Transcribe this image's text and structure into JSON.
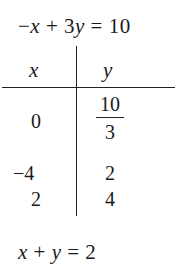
{
  "title_equation": {
    "parts": [
      "−",
      "x",
      " + 3",
      "y",
      " = 10"
    ]
  },
  "table": {
    "headers": {
      "x": "x",
      "y": "y"
    },
    "rows": [
      {
        "x": "0",
        "y_num": "10",
        "y_den": "3"
      },
      {
        "x": "−4",
        "y": "2"
      },
      {
        "x": "2",
        "y": "4"
      }
    ]
  },
  "next_equation": {
    "parts": [
      "x",
      " + ",
      "y",
      " = 2"
    ]
  }
}
